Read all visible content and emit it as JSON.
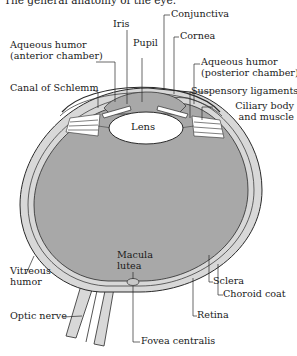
{
  "title": "The general anatomy of the eye.",
  "colors": {
    "vitreous_fill": "#a8a8a8",
    "sclera_fill": "#d8d8d8",
    "line": "#2a2a2a",
    "lens_fill": "#ffffff"
  },
  "labels": {
    "iris": "Iris",
    "conjunctiva": "Conjunctiva",
    "cornea": "Cornea",
    "pupil": "Pupil",
    "aqueous_anterior_1": "Aqueous humor",
    "aqueous_anterior_2": "(anterior chamber)",
    "aqueous_posterior_1": "Aqueous humor",
    "aqueous_posterior_2": "(posterior chamber)",
    "canal_of_schlemm": "Canal of Schlemm",
    "suspensory_ligaments": "Suspensory ligaments",
    "ciliary_1": "Ciliary body",
    "ciliary_2": "and muscle",
    "lens": "Lens",
    "vitreous_1": "Vitreous",
    "vitreous_2": "humor",
    "macula_1": "Macula",
    "macula_2": "lutea",
    "sclera": "Sclera",
    "choroid": "Choroid coat",
    "optic_nerve": "Optic nerve",
    "retina": "Retina",
    "fovea": "Fovea centralis"
  }
}
